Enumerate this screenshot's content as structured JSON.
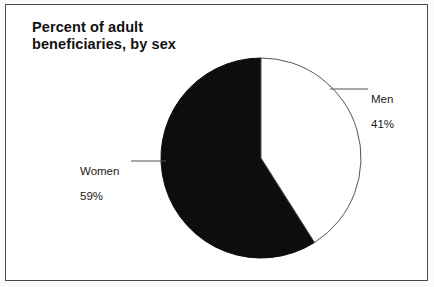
{
  "figure": {
    "title": "Percent of adult\nbeneficiaries, by sex",
    "background_color": "#fbfbfa",
    "frame_color": "#4a4a4a",
    "text_color": "#1a1a1a"
  },
  "chart_data": {
    "type": "pie",
    "title": "Percent of adult beneficiaries, by sex",
    "xlabel": "",
    "ylabel": "",
    "grid": false,
    "legend_position": "callout-labels",
    "start_angle_deg": 0,
    "direction": "clockwise",
    "units": "percent",
    "categories": [
      "Men",
      "Women"
    ],
    "values": [
      41,
      59
    ],
    "slices": [
      {
        "label": "Men",
        "value": 41,
        "value_text": "41%",
        "color": "#ffffff",
        "stroke": "#555555",
        "callout": "right"
      },
      {
        "label": "Women",
        "value": 59,
        "value_text": "59%",
        "color": "#0d0d0d",
        "stroke": "#0d0d0d",
        "callout": "left"
      }
    ],
    "annotations": [
      {
        "text": "Men",
        "detail": "41%"
      },
      {
        "text": "Women",
        "detail": "59%"
      }
    ]
  },
  "labels": {
    "men": {
      "name": "Men",
      "value": "41%"
    },
    "women": {
      "name": "Women",
      "value": "59%"
    }
  }
}
